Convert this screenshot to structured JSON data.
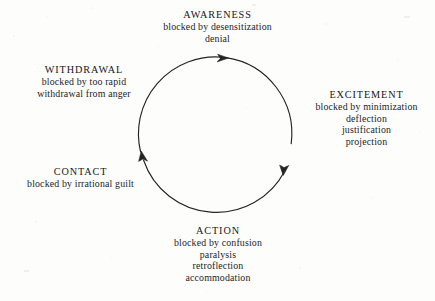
{
  "diagram": {
    "type": "cycle",
    "direction": "clockwise",
    "background_color": "#fdfdfc",
    "stroke_color": "#222222",
    "circle": {
      "center_x": 215,
      "center_y": 134,
      "radius": 77
    },
    "arrowheads": [
      {
        "name": "top-arrowhead",
        "x": 226,
        "y": 58,
        "direction": "right"
      },
      {
        "name": "right-arrowhead",
        "x": 284,
        "y": 172,
        "direction": "down"
      },
      {
        "name": "left-arrowhead",
        "x": 143,
        "y": 158,
        "direction": "up"
      }
    ],
    "nodes": [
      {
        "id": "awareness",
        "title": "AWARENESS",
        "lines": [
          "blocked by desensitization",
          "denial"
        ]
      },
      {
        "id": "excitement",
        "title": "EXCITEMENT",
        "lines": [
          "blocked by minimization",
          "deflection",
          "justification",
          "projection"
        ]
      },
      {
        "id": "action",
        "title": "ACTION",
        "lines": [
          "blocked by confusion",
          "paralysis",
          "retroflection",
          "accommodation"
        ]
      },
      {
        "id": "contact",
        "title": "CONTACT",
        "lines": [
          "blocked by irrational guilt"
        ]
      },
      {
        "id": "withdrawal",
        "title": "WITHDRAWAL",
        "lines": [
          "blocked by too rapid",
          "withdrawal from anger"
        ]
      }
    ]
  }
}
